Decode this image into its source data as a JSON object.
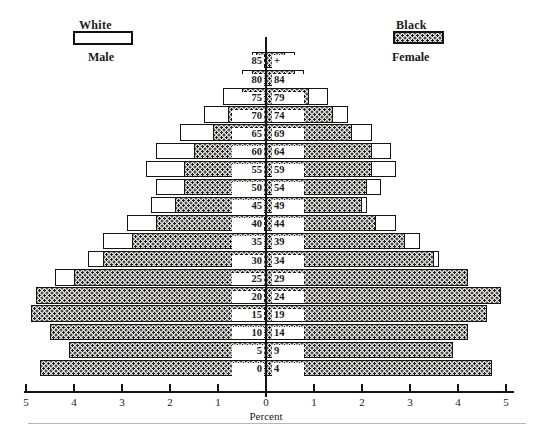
{
  "legend": {
    "white": {
      "label": "White",
      "swatch": "hollow-rectangle"
    },
    "black": {
      "label": "Black",
      "swatch": "stippled-rectangle"
    }
  },
  "sides": {
    "left": "Male",
    "right": "Female"
  },
  "axis": {
    "title": "Percent",
    "ticks": [
      "5",
      "4",
      "3",
      "2",
      "1",
      "0",
      "1",
      "2",
      "3",
      "4",
      "5"
    ]
  },
  "chart_data": {
    "type": "bar",
    "subtype": "population-pyramid",
    "title": "",
    "xlabel": "Percent",
    "ylabel": "",
    "xlim": [
      -5,
      5
    ],
    "grid": false,
    "legend_position": "top",
    "legend_entries": [
      "White",
      "Black"
    ],
    "side_labels": [
      "Male",
      "Female"
    ],
    "categories": [
      "85+",
      "80-84",
      "75-79",
      "70-74",
      "65-69",
      "60-64",
      "55-59",
      "50-54",
      "45-49",
      "40-44",
      "35-39",
      "30-34",
      "25-29",
      "20-24",
      "15-19",
      "10-14",
      "5-9",
      "0-4"
    ],
    "xticks": [
      -5,
      -4,
      -3,
      -2,
      -1,
      0,
      1,
      2,
      3,
      4,
      5
    ],
    "xticklabels": [
      "5",
      "4",
      "3",
      "2",
      "1",
      "0",
      "1",
      "2",
      "3",
      "4",
      "5"
    ],
    "series": [
      {
        "name": "White Male",
        "side": "left",
        "values": [
          0.3,
          0.5,
          0.9,
          1.3,
          1.8,
          2.3,
          2.5,
          2.3,
          2.4,
          2.9,
          3.4,
          3.7,
          4.4,
          4.5,
          4.1,
          3.4,
          3.0,
          3.3
        ]
      },
      {
        "name": "Black Male",
        "side": "left",
        "values": [
          0.2,
          0.3,
          0.5,
          0.8,
          1.1,
          1.5,
          1.7,
          1.7,
          1.9,
          2.3,
          2.8,
          3.4,
          4.0,
          4.8,
          4.9,
          4.5,
          4.1,
          4.7
        ]
      },
      {
        "name": "White Female",
        "side": "right",
        "values": [
          0.6,
          0.8,
          1.3,
          1.7,
          2.2,
          2.6,
          2.7,
          2.4,
          2.1,
          2.7,
          3.2,
          3.6,
          4.1,
          4.2,
          3.7,
          3.2,
          2.9,
          3.5
        ]
      },
      {
        "name": "Black Female",
        "side": "right",
        "values": [
          0.4,
          0.6,
          0.9,
          1.4,
          1.8,
          2.2,
          2.2,
          2.1,
          2.0,
          2.3,
          2.9,
          3.5,
          4.2,
          4.9,
          4.6,
          4.2,
          3.9,
          4.7
        ]
      }
    ]
  }
}
